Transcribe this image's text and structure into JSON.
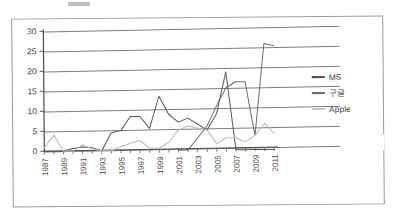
{
  "document": {
    "kind": "scanned-chart-figure",
    "frame_visible": true
  },
  "chart_data": {
    "type": "line",
    "title": "",
    "subtitle": "",
    "xlabel": "",
    "ylabel": "",
    "grid": true,
    "legend_position": "right",
    "ylim": [
      0,
      30
    ],
    "yticks": [
      0,
      5,
      10,
      15,
      20,
      25,
      30
    ],
    "ytick_labels": [
      "0",
      "5",
      "10",
      "15",
      "20",
      "25",
      "30"
    ],
    "x": [
      1987,
      1988,
      1989,
      1990,
      1991,
      1992,
      1993,
      1994,
      1995,
      1996,
      1997,
      1998,
      1999,
      2000,
      2001,
      2002,
      2003,
      2004,
      2005,
      2006,
      2007,
      2008,
      2009,
      2010,
      2011
    ],
    "xtick_labels": [
      "1987",
      "1989",
      "1991",
      "1993",
      "1995",
      "1997",
      "1999",
      "2001",
      "2003",
      "2005",
      "2007",
      "2009",
      "2011"
    ],
    "xtick_label_years": [
      1987,
      1989,
      1991,
      1993,
      1995,
      1997,
      1999,
      2001,
      2003,
      2005,
      2007,
      2009,
      2011
    ],
    "xlim": [
      1987,
      2011
    ],
    "series": [
      {
        "name": "MS",
        "color": "#555555",
        "values": [
          0,
          0,
          0,
          0.6,
          1,
          0.8,
          0,
          4.5,
          5,
          8.5,
          8.5,
          5.5,
          13.5,
          9,
          7,
          8,
          6.5,
          5,
          9,
          19.5,
          0,
          0,
          0,
          0,
          0
        ]
      },
      {
        "name": "구글",
        "color": "#6b6b6b",
        "values": [
          null,
          null,
          null,
          null,
          null,
          null,
          null,
          null,
          null,
          null,
          null,
          null,
          null,
          null,
          0,
          0,
          3,
          6,
          11,
          15.5,
          17,
          17,
          3.5,
          26.5,
          26
        ]
      },
      {
        "name": "Apple",
        "color": "#bdbdbd",
        "values": [
          0.8,
          4,
          0,
          0,
          1.5,
          0.5,
          0,
          0,
          1,
          1.8,
          2.5,
          0.5,
          0.5,
          2,
          5,
          6,
          5.5,
          5,
          1.5,
          3,
          3,
          2,
          3.5,
          6.5,
          4
        ]
      }
    ],
    "legend": [
      {
        "label": "MS",
        "color": "#555555"
      },
      {
        "label": "구글",
        "color": "#6b6b6b"
      },
      {
        "label": "Apple",
        "color": "#bdbdbd"
      }
    ]
  }
}
